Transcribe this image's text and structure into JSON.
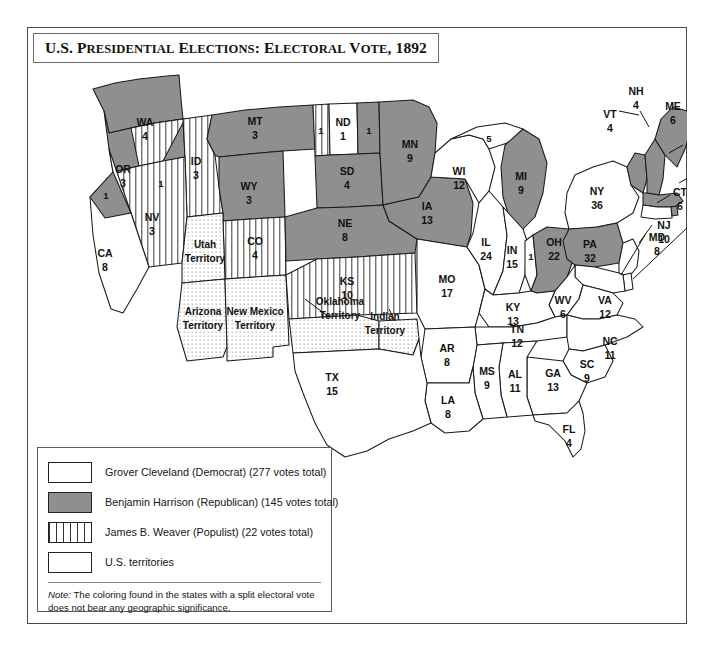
{
  "title": {
    "lead": "U.S. P",
    "full": "U.S. PRESIDENTIAL ELECTIONS: ELECTORAL VOTE, 1892",
    "part1": "U.S. P",
    "part1b": "RESIDENTIAL",
    "part2": " E",
    "part2b": "LECTIONS",
    "part3": ": E",
    "part3b": "LECTORAL",
    "part4": " V",
    "part4b": "OTE",
    "part5": ", 1892"
  },
  "colors": {
    "republican_gray": "#8f8f8f",
    "democrat_white": "#ffffff",
    "outline": "#1a1a1a",
    "frame": "#4a4a4a"
  },
  "legend": {
    "items": [
      {
        "swatch": "white",
        "label": "Grover Cleveland (Democrat) (277 votes total)"
      },
      {
        "swatch": "gray",
        "label": "Benjamin Harrison (Republican) (145 votes total)"
      },
      {
        "swatch": "striped",
        "label": "James B. Weaver (Populist) (22 votes total)"
      },
      {
        "swatch": "dotted",
        "label": "U.S. territories"
      }
    ],
    "note_prefix": "Note:",
    "note": " The coloring found in the states with a split electoral vote does not bear any geographic significance."
  },
  "map": {
    "states": [
      {
        "code": "WA",
        "votes": "4",
        "fill": "gray"
      },
      {
        "code": "OR",
        "votes": "3",
        "fill": "gray"
      },
      {
        "code": "OR-split",
        "votes": "1",
        "fill": "striped"
      },
      {
        "code": "CA",
        "votes": "8",
        "fill": "white"
      },
      {
        "code": "CA-split",
        "votes": "1",
        "fill": "gray"
      },
      {
        "code": "NV",
        "votes": "3",
        "fill": "striped"
      },
      {
        "code": "ID",
        "votes": "3",
        "fill": "striped"
      },
      {
        "code": "MT",
        "votes": "3",
        "fill": "gray"
      },
      {
        "code": "WY",
        "votes": "3",
        "fill": "gray"
      },
      {
        "code": "CO",
        "votes": "4",
        "fill": "striped"
      },
      {
        "code": "ND",
        "votes": "1",
        "fill": "white"
      },
      {
        "code": "ND-weaver",
        "votes": "1",
        "fill": "striped"
      },
      {
        "code": "ND-harrison",
        "votes": "1",
        "fill": "gray"
      },
      {
        "code": "SD",
        "votes": "4",
        "fill": "gray"
      },
      {
        "code": "NE",
        "votes": "8",
        "fill": "gray"
      },
      {
        "code": "KS",
        "votes": "10",
        "fill": "striped"
      },
      {
        "code": "MN",
        "votes": "9",
        "fill": "gray"
      },
      {
        "code": "IA",
        "votes": "13",
        "fill": "gray"
      },
      {
        "code": "MO",
        "votes": "17",
        "fill": "white"
      },
      {
        "code": "WI",
        "votes": "12",
        "fill": "white"
      },
      {
        "code": "MI",
        "votes": "9",
        "fill": "gray"
      },
      {
        "code": "MI-split",
        "votes": "5",
        "fill": "white"
      },
      {
        "code": "IL",
        "votes": "24",
        "fill": "white"
      },
      {
        "code": "IN",
        "votes": "15",
        "fill": "white"
      },
      {
        "code": "OH",
        "votes": "22",
        "fill": "gray"
      },
      {
        "code": "OH-split",
        "votes": "1",
        "fill": "white"
      },
      {
        "code": "KY",
        "votes": "13",
        "fill": "white"
      },
      {
        "code": "WV",
        "votes": "6",
        "fill": "white"
      },
      {
        "code": "VA",
        "votes": "12",
        "fill": "white"
      },
      {
        "code": "TN",
        "votes": "12",
        "fill": "white"
      },
      {
        "code": "NC",
        "votes": "11",
        "fill": "white"
      },
      {
        "code": "SC",
        "votes": "9",
        "fill": "white"
      },
      {
        "code": "GA",
        "votes": "13",
        "fill": "white"
      },
      {
        "code": "FL",
        "votes": "4",
        "fill": "white"
      },
      {
        "code": "AL",
        "votes": "11",
        "fill": "white"
      },
      {
        "code": "MS",
        "votes": "9",
        "fill": "white"
      },
      {
        "code": "LA",
        "votes": "8",
        "fill": "white"
      },
      {
        "code": "AR",
        "votes": "8",
        "fill": "white"
      },
      {
        "code": "TX",
        "votes": "15",
        "fill": "white"
      },
      {
        "code": "NY",
        "votes": "36",
        "fill": "white"
      },
      {
        "code": "PA",
        "votes": "32",
        "fill": "gray"
      },
      {
        "code": "ME",
        "votes": "6",
        "fill": "gray"
      },
      {
        "code": "NH",
        "votes": "4",
        "fill": "gray"
      },
      {
        "code": "VT",
        "votes": "4",
        "fill": "gray"
      },
      {
        "code": "MA",
        "votes": "15",
        "fill": "gray"
      },
      {
        "code": "RI",
        "votes": "4",
        "fill": "gray"
      },
      {
        "code": "CT",
        "votes": "6",
        "fill": "white"
      },
      {
        "code": "NJ",
        "votes": "10",
        "fill": "white"
      },
      {
        "code": "DE",
        "votes": "3",
        "fill": "white"
      },
      {
        "code": "MD",
        "votes": "8",
        "fill": "white"
      }
    ],
    "territories": [
      {
        "name_line1": "Utah",
        "name_line2": "Territory"
      },
      {
        "name_line1": "Arizona",
        "name_line2": "Territory"
      },
      {
        "name_line1": "New Mexico",
        "name_line2": "Territory"
      },
      {
        "name_line1": "Oklahoma",
        "name_line2": "Territory"
      },
      {
        "name_line1": "Indian",
        "name_line2": "Territory"
      }
    ]
  }
}
